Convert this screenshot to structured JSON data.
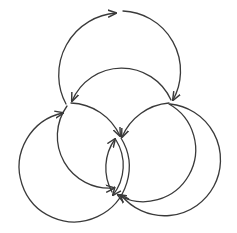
{
  "diagram": {
    "stroke_color": "#3a3a3a",
    "background_color": "#ffffff",
    "arcs": [
      {
        "id": "top-left",
        "d": "M 66 104 A 62 62 0 0 1 116 13"
      },
      {
        "id": "top-right",
        "d": "M 123 11 A 60 60 0 0 1 173 100"
      },
      {
        "id": "mid-top",
        "d": "M 171 100 A 54 54 0 0 0 72 101"
      },
      {
        "id": "left-upper-to-center",
        "d": "M 71 103 A 56 56 0 0 1 120 136"
      },
      {
        "id": "right-upper-to-center",
        "d": "M 169 103 A 56 56 0 0 0 122 137"
      },
      {
        "id": "left-inner-down",
        "d": "M 67 106 A 52 52 0 0 0 114 188"
      },
      {
        "id": "right-inner-down",
        "d": "M 169 104 A 52 52 0 0 1 118 195"
      },
      {
        "id": "left-outer",
        "d": "M 121 138 A 55 55 0 1 1 63 113"
      },
      {
        "id": "right-outer",
        "d": "M 170 104 A 56 56 0 1 1 121 195"
      },
      {
        "id": "center-left-up",
        "d": "M 112 192 A 50 50 0 0 1 115 139"
      },
      {
        "id": "center-right-down",
        "d": "M 116 140 A 48 48 0 0 1 113 195"
      }
    ]
  }
}
